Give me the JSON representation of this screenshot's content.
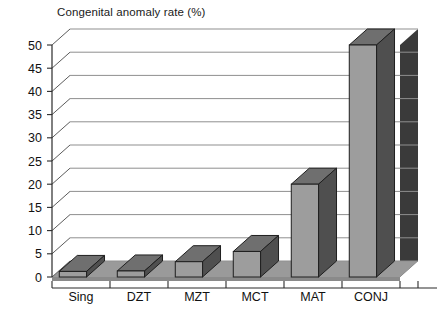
{
  "chart_data": {
    "type": "bar",
    "title": "Congenital anomaly rate (%)",
    "xlabel": "",
    "ylabel": "",
    "ylim": [
      0,
      50
    ],
    "ytick_step": 5,
    "yticks": [
      "0",
      "5",
      "10",
      "15",
      "20",
      "25",
      "30",
      "35",
      "40",
      "45",
      "50"
    ],
    "grid": true,
    "legend": false,
    "legend_position": "none",
    "style": "3d-column",
    "categories": [
      "Sing",
      "DZT",
      "MZT",
      "MCT",
      "MAT",
      "CONJ"
    ],
    "values": [
      1.2,
      1.3,
      3.3,
      5.5,
      20,
      50
    ],
    "colors": {
      "bar_front": "#9d9d9d",
      "bar_side": "#4f4f4f",
      "bar_top": "#6f6f6f",
      "floor": "#9a9a9a",
      "wall": "#ffffff",
      "gridline": "#8f8f8f",
      "axis": "#2b2b2b",
      "text": "#111111"
    }
  },
  "axes": {
    "y_tick_labels": [
      "50",
      "45",
      "40",
      "35",
      "30",
      "25",
      "20",
      "15",
      "10",
      "5",
      "0"
    ],
    "x_tick_labels": [
      "Sing",
      "DZT",
      "MZT",
      "MCT",
      "MAT",
      "CONJ"
    ]
  }
}
